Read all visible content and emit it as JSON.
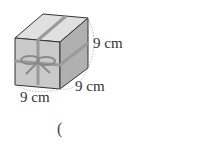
{
  "figure": {
    "object": "gift box cube with ribbon bow",
    "dimensions": [
      {
        "edge": "height",
        "label": "9 cm"
      },
      {
        "edge": "depth",
        "label": "9 cm"
      },
      {
        "edge": "width",
        "label": "9 cm"
      }
    ]
  },
  "answer": {
    "open_paren": "("
  }
}
